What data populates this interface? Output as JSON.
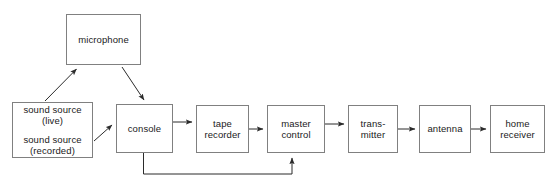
{
  "diagram": {
    "background_color": "#ffffff",
    "border_color": "#808080",
    "text_color": "#1a1a1a",
    "arrow_color": "#2b2b2b",
    "nodes": [
      {
        "id": "microphone",
        "labels": [
          "microphone"
        ],
        "x": 66,
        "y": 14,
        "w": 75,
        "h": 51
      },
      {
        "id": "sound-source",
        "labels": [
          "sound source\n(live)",
          "sound source\n(recorded)"
        ],
        "x": 12,
        "y": 102,
        "w": 81,
        "h": 56
      },
      {
        "id": "console",
        "labels": [
          "console"
        ],
        "x": 116,
        "y": 104,
        "w": 57,
        "h": 49
      },
      {
        "id": "tape-recorder",
        "labels": [
          "tape\nrecorder"
        ],
        "x": 196,
        "y": 105,
        "w": 53,
        "h": 48
      },
      {
        "id": "master-control",
        "labels": [
          "master\ncontrol"
        ],
        "x": 267,
        "y": 105,
        "w": 58,
        "h": 48
      },
      {
        "id": "transmitter",
        "labels": [
          "trans-\nmitter"
        ],
        "x": 348,
        "y": 105,
        "w": 50,
        "h": 48
      },
      {
        "id": "antenna",
        "labels": [
          "antenna"
        ],
        "x": 419,
        "y": 105,
        "w": 52,
        "h": 48
      },
      {
        "id": "home-receiver",
        "labels": [
          "home\nreceiver"
        ],
        "x": 490,
        "y": 105,
        "w": 55,
        "h": 48
      }
    ],
    "connections": [
      {
        "id": "sound-source-to-microphone",
        "from": "sound-source",
        "to": "microphone",
        "kind": "diagonal"
      },
      {
        "id": "microphone-to-console",
        "from": "microphone",
        "to": "console",
        "kind": "diagonal"
      },
      {
        "id": "sound-source-to-console",
        "from": "sound-source",
        "to": "console",
        "kind": "diagonal"
      },
      {
        "id": "console-to-tape-recorder",
        "from": "console",
        "to": "tape-recorder",
        "kind": "straight"
      },
      {
        "id": "tape-recorder-to-master-control",
        "from": "tape-recorder",
        "to": "master-control",
        "kind": "straight"
      },
      {
        "id": "master-control-to-transmitter",
        "from": "master-control",
        "to": "transmitter",
        "kind": "straight"
      },
      {
        "id": "transmitter-to-antenna",
        "from": "transmitter",
        "to": "antenna",
        "kind": "straight"
      },
      {
        "id": "antenna-to-home-receiver",
        "from": "antenna",
        "to": "home-receiver",
        "kind": "straight"
      },
      {
        "id": "console-to-master-control-feedback",
        "from": "console",
        "to": "master-control",
        "kind": "elbow"
      }
    ]
  }
}
